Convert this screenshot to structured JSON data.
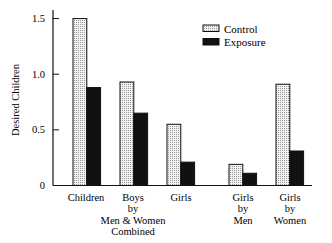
{
  "chart_data": {
    "type": "bar",
    "title": "",
    "xlabel": "",
    "ylabel": "Desired Children",
    "ylim": [
      0,
      1.5
    ],
    "yticks": [
      "0",
      "0.5",
      "1.0",
      "1.5"
    ],
    "grid": false,
    "legend_position": "upper right",
    "categories": [
      "Children",
      "Boys by Men & Women Combined",
      "Girls",
      "Girls by Men",
      "Girls by Women"
    ],
    "category_label_lines": [
      [
        "Children"
      ],
      [
        "Boys",
        "by",
        "Men & Women",
        "Combined"
      ],
      [
        "Girls"
      ],
      [
        "Girls",
        "by",
        "Men"
      ],
      [
        "Girls",
        "by",
        "Women"
      ]
    ],
    "series": [
      {
        "name": "Control",
        "pattern": "dotted-light",
        "values": [
          1.5,
          0.93,
          0.55,
          0.19,
          0.91
        ]
      },
      {
        "name": "Exposure",
        "pattern": "solid-black",
        "values": [
          0.88,
          0.65,
          0.21,
          0.11,
          0.31
        ]
      }
    ]
  },
  "legend": {
    "control": "Control",
    "exposure": "Exposure"
  },
  "axis": {
    "ylabel": "Desired Children",
    "t0": "0",
    "t05": "0.5",
    "t10": "1.0",
    "t15": "1.5"
  }
}
